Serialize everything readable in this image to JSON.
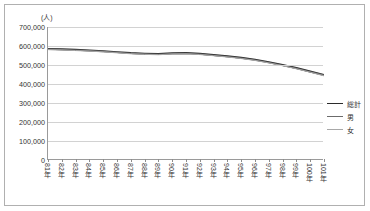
{
  "unit_label": "(人)",
  "legend": {
    "position": "right-middle",
    "items": [
      {
        "label": "総計",
        "color": "#2b2b2b",
        "width": 1.9
      },
      {
        "label": "男",
        "color": "#6b6b6b",
        "width": 1.3
      },
      {
        "label": "女",
        "color": "#a8a8a8",
        "width": 1.0
      }
    ]
  },
  "yaxis": {
    "ticks": [
      "700,000",
      "600,000",
      "500,000",
      "400,000",
      "300,000",
      "200,000",
      "100,000",
      "0"
    ]
  },
  "chart_data": {
    "type": "line",
    "title": "",
    "subtitle": "",
    "xlabel": "",
    "ylabel": "(人)",
    "ylim": [
      0,
      700000
    ],
    "ytick_values": [
      0,
      100000,
      200000,
      300000,
      400000,
      500000,
      600000,
      700000
    ],
    "grid": true,
    "legend_position": "right",
    "categories": [
      "81年",
      "82年",
      "83年",
      "84年",
      "85年",
      "86年",
      "87年",
      "88年",
      "89年",
      "90年",
      "91年",
      "92年",
      "93年",
      "94年",
      "95年",
      "96年",
      "97年",
      "98年",
      "99年",
      "100年",
      "101年"
    ],
    "series": [
      {
        "name": "総計",
        "color": "#2b2b2b",
        "values": [
          585000,
          583000,
          580000,
          577000,
          573000,
          568000,
          563000,
          560000,
          558000,
          562000,
          563000,
          559000,
          553000,
          546000,
          538000,
          528000,
          515000,
          500000,
          484000,
          466000,
          448000
        ]
      },
      {
        "name": "男",
        "color": "#6b6b6b",
        "values": [
          583000,
          581000,
          578000,
          575000,
          571000,
          566000,
          561000,
          558000,
          556000,
          560000,
          561000,
          557000,
          551000,
          544000,
          536000,
          526000,
          513000,
          498000,
          482000,
          464000,
          446000
        ]
      },
      {
        "name": "女",
        "color": "#a8a8a8",
        "values": [
          581000,
          579000,
          576000,
          573000,
          569000,
          564000,
          559000,
          556000,
          554000,
          558000,
          559000,
          555000,
          549000,
          542000,
          534000,
          524000,
          511000,
          496000,
          480000,
          462000,
          443000
        ]
      }
    ]
  }
}
